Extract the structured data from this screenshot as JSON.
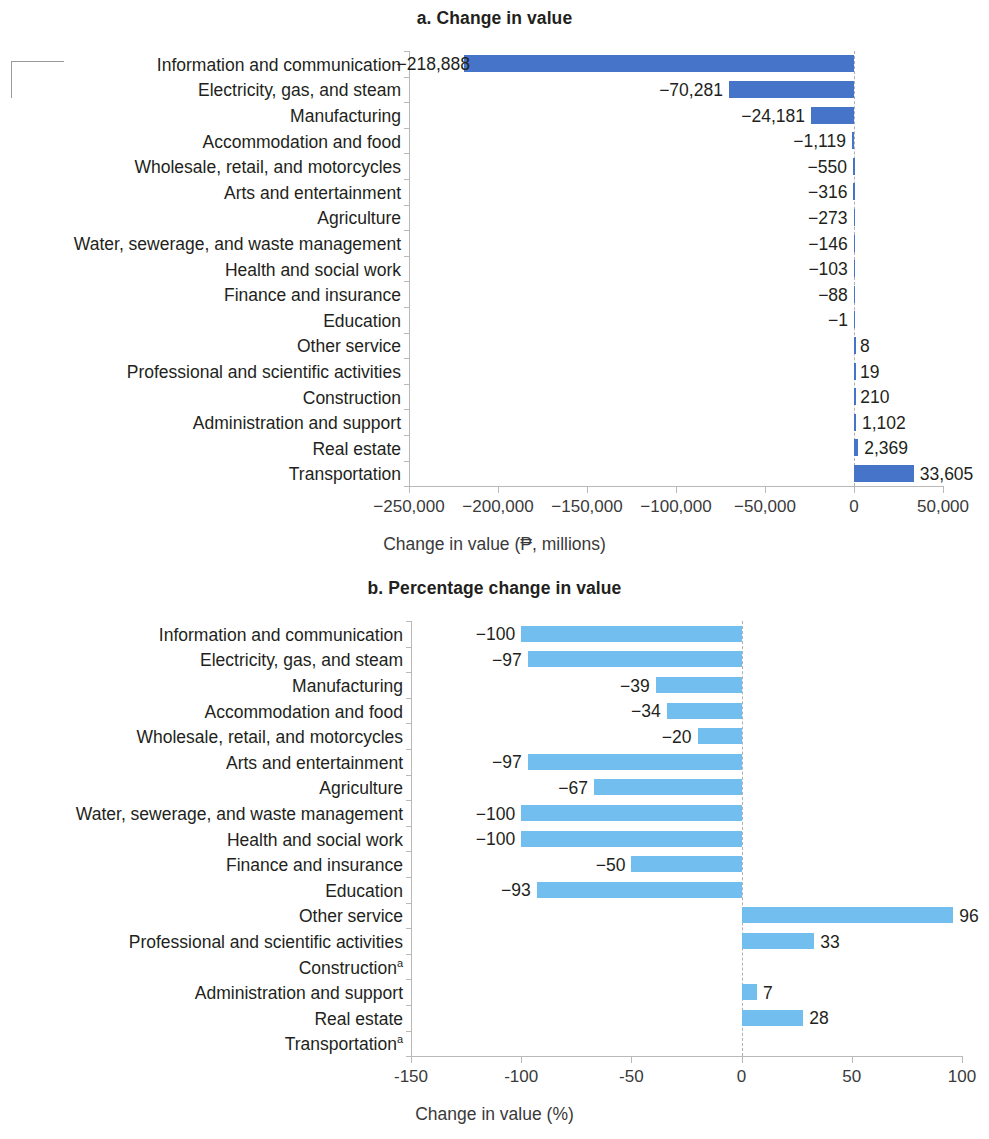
{
  "figure": {
    "panels": [
      {
        "id": "a",
        "title": "a. Change in value",
        "axis_title": "Change in value (₱, millions)"
      },
      {
        "id": "b",
        "title": "b. Percentage change in value",
        "axis_title": "Change in value (%)"
      }
    ]
  },
  "colors": {
    "bar_a": "#4674c8",
    "bar_b": "#72beee",
    "axis": "#b9b9b9",
    "text": "#231f20"
  },
  "chart_data": [
    {
      "type": "bar",
      "orientation": "horizontal",
      "title": "a. Change in value",
      "xlabel": "Change in value (₱, millions)",
      "ylabel": "",
      "xlim": [
        -250000,
        50000
      ],
      "xticks": [
        -250000,
        -200000,
        -150000,
        -100000,
        -50000,
        0,
        50000
      ],
      "xticklabels": [
        "−250,000",
        "−200,000",
        "−150,000",
        "−100,000",
        "−50,000",
        "0",
        "50,000"
      ],
      "grid": false,
      "legend": "none",
      "categories": [
        "Information and communication",
        "Electricity, gas, and steam",
        "Manufacturing",
        "Accommodation and food",
        "Wholesale, retail, and motorcycles",
        "Arts and entertainment",
        "Agriculture",
        "Water, sewerage, and waste management",
        "Health and social work",
        "Finance and insurance",
        "Education",
        "Other service",
        "Professional and scientific activities",
        "Construction",
        "Administration and support",
        "Real estate",
        "Transportation"
      ],
      "values": [
        -218888,
        -70281,
        -24181,
        -1119,
        -550,
        -316,
        -273,
        -146,
        -103,
        -88,
        -1,
        8,
        19,
        210,
        1102,
        2369,
        33605
      ],
      "data_labels": [
        "−218,888",
        "−70,281",
        "−24,181",
        "−1,119",
        "−550",
        "−316",
        "−273",
        "−146",
        "−103",
        "−88",
        "−1",
        "8",
        "19",
        "210",
        "1,102",
        "2,369",
        "33,605"
      ]
    },
    {
      "type": "bar",
      "orientation": "horizontal",
      "title": "b. Percentage change in value",
      "xlabel": "Change in value (%)",
      "ylabel": "",
      "xlim": [
        -150,
        100
      ],
      "xticks": [
        -150,
        -100,
        -50,
        0,
        50,
        100
      ],
      "xticklabels": [
        "-150",
        "-100",
        "-50",
        "0",
        "50",
        "100"
      ],
      "grid": false,
      "legend": "none",
      "categories": [
        "Information and communication",
        "Electricity, gas, and steam",
        "Manufacturing",
        "Accommodation and food",
        "Wholesale, retail, and motorcycles",
        "Arts and entertainment",
        "Agriculture",
        "Water, sewerage, and waste management",
        "Health and social work",
        "Finance and insurance",
        "Education",
        "Other service",
        "Professional and scientific activities",
        "Construction",
        "Administration and support",
        "Real estate",
        "Transportation"
      ],
      "category_footnotes": {
        "Construction": "a",
        "Transportation": "a"
      },
      "values": [
        -100,
        -97,
        -39,
        -34,
        -20,
        -97,
        -67,
        -100,
        -100,
        -50,
        -93,
        96,
        33,
        null,
        7,
        28,
        null
      ],
      "data_labels": [
        "−100",
        "−97",
        "−39",
        "−34",
        "−20",
        "−97",
        "−67",
        "−100",
        "−100",
        "−50",
        "−93",
        "96",
        "33",
        "",
        "7",
        "28",
        ""
      ]
    }
  ]
}
